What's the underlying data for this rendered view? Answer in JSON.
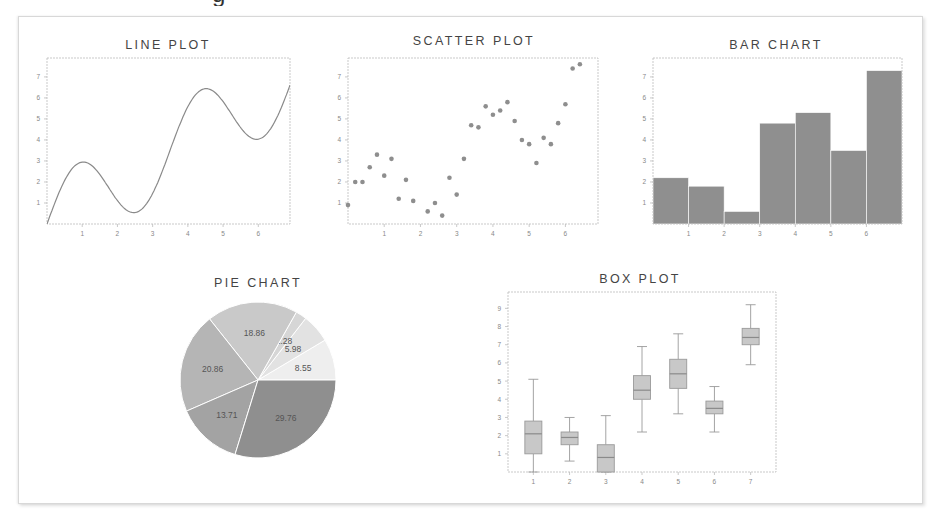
{
  "figure": {
    "clipped_heading_visible_fragment": "g",
    "colors": {
      "frame": "#bbbbbb",
      "line": "#8a8a8a",
      "scatter": "#8e8e8e",
      "bar": "#8f8f8f",
      "box_fill": "#c8c8c8",
      "box_edge": "#9a9a9a",
      "title": "#444444",
      "tick": "#888888",
      "pie": [
        "#eeeeee",
        "#e2e2e2",
        "#d6d6d6",
        "#c9c9c9",
        "#b5b5b5",
        "#a3a3a3",
        "#8f8f8f"
      ]
    }
  },
  "chart_data": [
    {
      "type": "line",
      "title": "LINE PLOT",
      "xlabel": "",
      "ylabel": "",
      "xlim": [
        0,
        6.9
      ],
      "ylim": [
        0,
        7.9
      ],
      "xticks": [
        1,
        2,
        3,
        4,
        5,
        6
      ],
      "yticks": [
        1,
        2,
        3,
        4,
        5,
        6,
        7
      ],
      "grid": false,
      "function": "x + 2*sin(1.8*x)",
      "x": [
        0,
        0.25,
        0.5,
        0.75,
        0.87,
        1.0,
        1.25,
        1.5,
        1.75,
        2.0,
        2.25,
        2.5,
        2.75,
        3.0,
        3.25,
        3.5,
        3.75,
        4.0,
        4.25,
        4.5,
        4.75,
        5.0,
        5.25,
        5.5,
        5.75,
        6.0,
        6.25,
        6.5,
        6.75
      ],
      "y": [
        0.0,
        1.12,
        2.07,
        2.71,
        2.87,
        2.82,
        2.41,
        1.66,
        0.82,
        0.16,
        0.27,
        0.75,
        1.57,
        2.47,
        3.7,
        4.57,
        5.31,
        5.79,
        5.88,
        5.59,
        4.97,
        4.2,
        3.51,
        3.45,
        4.07,
        5.04,
        6.2,
        7.3,
        8.08
      ]
    },
    {
      "type": "scatter",
      "title": "SCATTER PLOT",
      "xlabel": "",
      "ylabel": "",
      "xlim": [
        0,
        6.9
      ],
      "ylim": [
        0,
        7.9
      ],
      "xticks": [
        1,
        2,
        3,
        4,
        5,
        6
      ],
      "yticks": [
        1,
        2,
        3,
        4,
        5,
        6,
        7
      ],
      "grid": false,
      "points": [
        [
          0.0,
          0.9
        ],
        [
          0.2,
          2.0
        ],
        [
          0.4,
          2.0
        ],
        [
          0.6,
          2.7
        ],
        [
          0.8,
          3.3
        ],
        [
          1.0,
          2.3
        ],
        [
          1.2,
          3.1
        ],
        [
          1.4,
          1.2
        ],
        [
          1.6,
          2.1
        ],
        [
          1.8,
          1.1
        ],
        [
          2.2,
          0.6
        ],
        [
          2.4,
          1.0
        ],
        [
          2.6,
          0.4
        ],
        [
          2.8,
          2.2
        ],
        [
          3.0,
          1.4
        ],
        [
          3.2,
          3.1
        ],
        [
          3.4,
          4.7
        ],
        [
          3.6,
          4.6
        ],
        [
          3.8,
          5.6
        ],
        [
          4.0,
          5.2
        ],
        [
          4.2,
          5.4
        ],
        [
          4.4,
          5.8
        ],
        [
          4.6,
          4.9
        ],
        [
          4.8,
          4.0
        ],
        [
          5.0,
          3.8
        ],
        [
          5.2,
          2.9
        ],
        [
          5.4,
          4.1
        ],
        [
          5.6,
          3.8
        ],
        [
          5.8,
          4.8
        ],
        [
          6.0,
          5.7
        ],
        [
          6.2,
          7.4
        ],
        [
          6.4,
          7.6
        ]
      ]
    },
    {
      "type": "bar",
      "title": "BAR CHART",
      "xlabel": "",
      "ylabel": "",
      "xlim": [
        0,
        7
      ],
      "ylim": [
        0,
        7.9
      ],
      "xticks": [
        1,
        2,
        3,
        4,
        5,
        6
      ],
      "yticks": [
        1,
        2,
        3,
        4,
        5,
        6,
        7
      ],
      "grid": false,
      "bar_left_edges": [
        0,
        1,
        2,
        3,
        4,
        5,
        6
      ],
      "bar_width": 1,
      "values": [
        2.2,
        1.8,
        0.6,
        4.8,
        5.3,
        3.5,
        7.3
      ]
    },
    {
      "type": "pie",
      "title": "PIE CHART",
      "start_angle_deg": 0,
      "direction": "counterclockwise",
      "values": [
        8.55,
        5.98,
        2.28,
        18.86,
        20.86,
        13.71,
        29.76
      ],
      "labels": [
        "8.55",
        "5.98",
        "2.28",
        "18.86",
        "20.86",
        "13.71",
        "29.76"
      ]
    },
    {
      "type": "box",
      "title": "BOX PLOT",
      "xlabel": "",
      "ylabel": "",
      "ylim": [
        0,
        9.9
      ],
      "xticks": [
        1,
        2,
        3,
        4,
        5,
        6,
        7
      ],
      "yticks": [
        1,
        2,
        3,
        4,
        5,
        6,
        7,
        8,
        9
      ],
      "grid": false,
      "categories": [
        "1",
        "2",
        "3",
        "4",
        "5",
        "6",
        "7"
      ],
      "boxes": [
        {
          "min": 0.0,
          "q1": 1.0,
          "median": 2.1,
          "q3": 2.8,
          "max": 5.1
        },
        {
          "min": 0.6,
          "q1": 1.5,
          "median": 1.9,
          "q3": 2.2,
          "max": 3.0
        },
        {
          "min": 0.0,
          "q1": 0.0,
          "median": 0.8,
          "q3": 1.5,
          "max": 3.1
        },
        {
          "min": 2.2,
          "q1": 4.0,
          "median": 4.5,
          "q3": 5.3,
          "max": 6.9
        },
        {
          "min": 3.2,
          "q1": 4.6,
          "median": 5.4,
          "q3": 6.2,
          "max": 7.6
        },
        {
          "min": 2.2,
          "q1": 3.2,
          "median": 3.5,
          "q3": 3.9,
          "max": 4.7
        },
        {
          "min": 5.9,
          "q1": 7.0,
          "median": 7.4,
          "q3": 7.9,
          "max": 9.2
        }
      ]
    }
  ]
}
